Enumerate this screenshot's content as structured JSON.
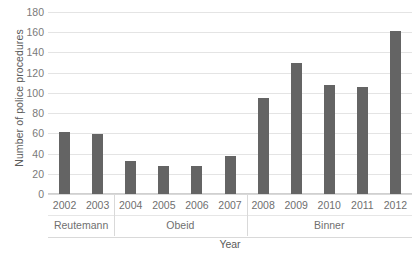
{
  "chart_data": {
    "type": "bar",
    "title": "",
    "xlabel": "Year",
    "ylabel": "Number of police procedures",
    "categories": [
      "2002",
      "2003",
      "2004",
      "2005",
      "2006",
      "2007",
      "2008",
      "2009",
      "2010",
      "2011",
      "2012"
    ],
    "values": [
      61,
      59,
      33,
      28,
      28,
      38,
      95,
      130,
      108,
      106,
      161
    ],
    "ylim": [
      0,
      180
    ],
    "ytick_step": 20,
    "yticks": [
      0,
      20,
      40,
      60,
      80,
      100,
      120,
      140,
      160,
      180
    ],
    "ytick_labels": [
      "0",
      "20",
      "40",
      "60",
      "80",
      "100",
      "120",
      "140",
      "160",
      "180"
    ],
    "grid": true,
    "legend": false,
    "bar_color": "#646464",
    "gridline_color": "#e4e4e4",
    "groups": [
      {
        "label": "Reutemann",
        "categories": [
          "2002",
          "2003"
        ]
      },
      {
        "label": "Obeid",
        "categories": [
          "2004",
          "2005",
          "2006",
          "2007"
        ]
      },
      {
        "label": "Binner",
        "categories": [
          "2008",
          "2009",
          "2010",
          "2011",
          "2012"
        ]
      }
    ]
  }
}
